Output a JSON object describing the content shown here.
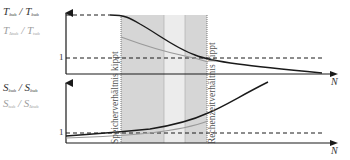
{
  "top_chart": {
    "y_label_primary": {
      "base": "T",
      "sub1": "δ_sub",
      "sep": " / ",
      "base2": "T",
      "sub2": "δ_sub"
    },
    "y_label_secondary": {
      "base": "T",
      "sub1": "Δt_sub",
      "sep": " / ",
      "base2": "T",
      "sub2": "t_sub"
    },
    "y_tick_label": "1",
    "x_axis_label": "N"
  },
  "bottom_chart": {
    "y_label_primary": {
      "base": "S",
      "sub1": "δ_sub",
      "sep": " / ",
      "base2": "S",
      "sub2": "δ_sub"
    },
    "y_label_secondary": {
      "base": "S",
      "sub1": "t_sub",
      "sep": " / ",
      "base2": "S",
      "sub2": "Δt_sub"
    },
    "y_tick_label": "1",
    "x_axis_label": "N"
  },
  "annotations": {
    "left_boundary": "Speicherverhältnis kippt",
    "right_boundary": "Rechenzeitverhältnis kippt"
  },
  "colors": {
    "axis": "#1a1a1a",
    "primary_curve": "#1a1a1a",
    "secondary_curve": "#9a9a9a",
    "band_dark": "#d6d6d6",
    "band_light": "#ececec",
    "band_edge": "#8a8a8a",
    "label_dark": "#333333",
    "label_light": "#a0a0a0"
  },
  "labels_render": {
    "top_primary": "T",
    "top_primary_sub": "δsub",
    "top_primary_sep": " / T",
    "top_primary_sub2": "δsub",
    "top_secondary": "T",
    "top_secondary_sub": "Δtsub",
    "top_secondary_sep": " / T",
    "top_secondary_sub2": "tsub",
    "bot_primary": "S",
    "bot_primary_sub": "δsub",
    "bot_primary_sep": " / S",
    "bot_primary_sub2": "δsub",
    "bot_secondary": "S",
    "bot_secondary_sub": "tsub",
    "bot_secondary_sep": " / S",
    "bot_secondary_sub2": "Δtsub"
  }
}
